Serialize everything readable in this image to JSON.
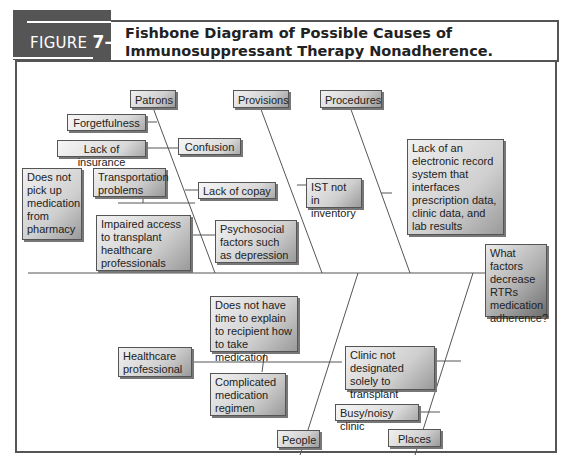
{
  "figure": {
    "label": "FIGURE",
    "number": "7–10",
    "title": "Fishbone Diagram of Possible Causes of Immunosuppressant Therapy Nonadherence."
  },
  "diagram": {
    "problem": "What factors decrease RTRs medication adherence?",
    "categories": {
      "patrons": "Patrons",
      "provisions": "Provisions",
      "procedures": "Procedures",
      "people": "People",
      "places": "Places"
    },
    "causes": {
      "forgetfulness": "Forgetfulness",
      "lack_of_insurance": "Lack of insurance",
      "confusion": "Confusion",
      "does_not_pick_up": "Does not pick up medication from pharmacy",
      "transportation": "Transportation problems",
      "lack_of_copay": "Lack of copay",
      "impaired_access": "Impaired access to transplant healthcare professionals",
      "psychosocial": "Psychosocial factors such as depression",
      "ist_not_in_inventory": "IST not in inventory",
      "lack_of_ehr": "Lack of an electronic record system that interfaces prescription data, clinic data, and lab results",
      "healthcare_professional": "Healthcare professional",
      "no_time_to_explain": "Does not have time to explain to recipient how to take medication",
      "complicated_regimen": "Complicated medication regimen",
      "clinic_not_designated": "Clinic not designated solely to transplant",
      "busy_clinic": "Busy/noisy clinic"
    }
  }
}
